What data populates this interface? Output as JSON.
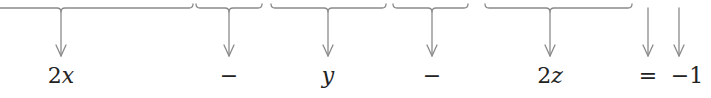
{
  "diagram": {
    "stroke_color": "#8a8a8a",
    "text_color": "#222222",
    "terms": [
      {
        "id": "term-2x",
        "coefficient": "2",
        "variable": "x",
        "x": 61
      },
      {
        "id": "op-minus-1",
        "coefficient": "−",
        "variable": "",
        "x": 229
      },
      {
        "id": "term-y",
        "coefficient": "",
        "variable": "y",
        "x": 328
      },
      {
        "id": "op-minus-2",
        "coefficient": "−",
        "variable": "",
        "x": 432
      },
      {
        "id": "term-2z",
        "coefficient": "2",
        "variable": "z",
        "x": 550
      },
      {
        "id": "op-equals",
        "coefficient": "=",
        "variable": "",
        "x": 648
      },
      {
        "id": "const-neg-1",
        "coefficient": "−1",
        "variable": "",
        "x": 685
      }
    ],
    "braces": [
      {
        "x1": 0,
        "x2": 193,
        "center": 61
      },
      {
        "x1": 196,
        "x2": 262,
        "center": 229
      },
      {
        "x1": 271,
        "x2": 386,
        "center": 328
      },
      {
        "x1": 393,
        "x2": 468,
        "center": 432
      },
      {
        "x1": 485,
        "x2": 632,
        "center": 550
      }
    ],
    "free_arrows": [
      648,
      679
    ]
  }
}
